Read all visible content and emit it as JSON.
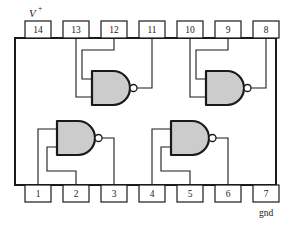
{
  "figure": {
    "kind": "ic-pinout-diagram",
    "colors": {
      "outline": "#1a1a1a",
      "gate_fill": "#cccccc",
      "wire": "#1a1a1a",
      "pin_fill": "#ffffff",
      "background": "#ffffff"
    }
  },
  "power": {
    "vplus_label": "V",
    "vplus_superscript": "+",
    "gnd_label": "gnd"
  },
  "package": {
    "body": {
      "x": 15,
      "y": 38,
      "width": 261,
      "height": 147
    },
    "pin_box": {
      "width": 26,
      "height": 17
    }
  },
  "pins": {
    "top": [
      {
        "number": "14",
        "x": 25,
        "y": 21
      },
      {
        "number": "13",
        "x": 63,
        "y": 21
      },
      {
        "number": "12",
        "x": 101,
        "y": 21
      },
      {
        "number": "11",
        "x": 139,
        "y": 21
      },
      {
        "number": "10",
        "x": 177,
        "y": 21
      },
      {
        "number": "9",
        "x": 215,
        "y": 21
      },
      {
        "number": "8",
        "x": 250,
        "y": 21
      }
    ],
    "bottom": [
      {
        "number": "1",
        "x": 25,
        "y": 185
      },
      {
        "number": "2",
        "x": 63,
        "y": 185
      },
      {
        "number": "3",
        "x": 101,
        "y": 185
      },
      {
        "number": "4",
        "x": 139,
        "y": 185
      },
      {
        "number": "5",
        "x": 177,
        "y": 185
      },
      {
        "number": "6",
        "x": 215,
        "y": 185
      },
      {
        "number": "7",
        "x": 250,
        "y": 185
      }
    ]
  },
  "gates": [
    {
      "id": "gate-top-left",
      "type": "nand",
      "body": {
        "x": 92,
        "y": 71,
        "width": 38,
        "height": 34
      },
      "bubble": {
        "cx": 133.5,
        "cy": 88,
        "r": 3.5
      },
      "inputs": [
        "12",
        "13"
      ],
      "output": "11"
    },
    {
      "id": "gate-top-right",
      "type": "nand",
      "body": {
        "x": 206,
        "y": 71,
        "width": 38,
        "height": 34
      },
      "bubble": {
        "cx": 247.5,
        "cy": 88,
        "r": 3.5
      },
      "inputs": [
        "9",
        "10"
      ],
      "output": "8"
    },
    {
      "id": "gate-bottom-left",
      "type": "nand",
      "body": {
        "x": 57,
        "y": 121,
        "width": 38,
        "height": 34
      },
      "bubble": {
        "cx": 98.5,
        "cy": 138,
        "r": 3.5
      },
      "inputs": [
        "1",
        "2"
      ],
      "output": "3"
    },
    {
      "id": "gate-bottom-right",
      "type": "nand",
      "body": {
        "x": 171,
        "y": 121,
        "width": 38,
        "height": 34
      },
      "bubble": {
        "cx": 212.5,
        "cy": 138,
        "r": 3.5
      },
      "inputs": [
        "4",
        "5"
      ],
      "output": "6"
    }
  ],
  "wires": {
    "gate_top_left": [
      "M76,38 L76,96 L92,96",
      "M114,38 L114,48 L76,48",
      "M76,48 L76,80 L92,80",
      "M137,88 L152,88 L152,38"
    ],
    "gate_top_right": [
      "M190,38 L190,96 L206,96",
      "M228,38 L228,48 L190,48",
      "M190,48 L190,80 L206,80",
      "M251,88 L266,88 L266,38"
    ],
    "gate_bottom_left": [
      "M38,185 L38,130 L57,130",
      "M76,185 L76,170 L57,170",
      "M57,170 L57,146 L57,146",
      "M102,138 L114,138 L114,185"
    ],
    "gate_bottom_right": [
      "M152,185 L152,130 L171,130",
      "M190,185 L190,170 L171,170",
      "M228,138 L228,185"
    ]
  }
}
